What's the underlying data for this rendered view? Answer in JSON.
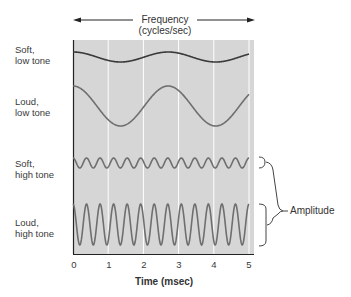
{
  "header": {
    "title_line1": "Frequency",
    "title_line2": "(cycles/sec)"
  },
  "rows": [
    {
      "label": "Soft,\nlow tone"
    },
    {
      "label": "Loud,\nlow tone"
    },
    {
      "label": "Soft,\nhigh tone"
    },
    {
      "label": "Loud,\nhigh tone"
    }
  ],
  "x_axis": {
    "title": "Time (msec)",
    "ticks": [
      "0",
      "1",
      "2",
      "3",
      "4",
      "5"
    ]
  },
  "annotation": {
    "label": "Amplitude"
  },
  "colors": {
    "panel": "#d6d6d6",
    "gridline": "#ffffff",
    "axis": "#222222",
    "soft_low": "#3a3a3a",
    "other_waves": "#6f6f6f"
  },
  "chart_data": {
    "type": "line",
    "title": "Frequency (cycles/sec)",
    "xlabel": "Time (msec)",
    "ylabel": "",
    "xlim": [
      0,
      5
    ],
    "x_ticks": [
      0,
      1,
      2,
      3,
      4,
      5
    ],
    "grid": "vertical",
    "series": [
      {
        "name": "Soft, low tone",
        "cycles_over_5_msec": 1.85,
        "relative_amplitude": 0.25,
        "phase": "starts at peak"
      },
      {
        "name": "Loud, low tone",
        "cycles_over_5_msec": 1.85,
        "relative_amplitude": 1.0,
        "phase": "starts at peak"
      },
      {
        "name": "Soft, high tone",
        "cycles_over_5_msec": 13,
        "relative_amplitude": 0.25,
        "phase": "starts at peak"
      },
      {
        "name": "Loud, high tone",
        "cycles_over_5_msec": 13,
        "relative_amplitude": 1.0,
        "phase": "starts at peak"
      }
    ],
    "annotations": [
      "Frequency (cycles/sec) — horizontal double arrow",
      "Amplitude — bracket spanning soft/loud high tone"
    ]
  }
}
